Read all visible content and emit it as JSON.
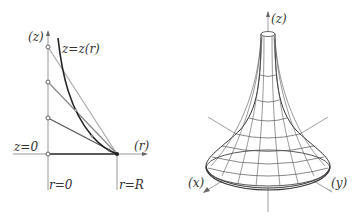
{
  "left_diagram": {
    "labels": {
      "z_axis": "(z)",
      "curve": "z=z(r)",
      "z_zero": "z=0",
      "r_axis": "(r)",
      "r_zero": "r=0",
      "r_R": "r=R"
    },
    "colors": {
      "curve": "#222222",
      "tangent_light": "#aaaaaa",
      "tangent_mid": "#888888",
      "tangent_dark": "#555555",
      "axis": "#999999"
    }
  },
  "right_diagram": {
    "labels": {
      "z_axis": "(z)",
      "x_axis": "(x)",
      "y_axis": "(y)"
    }
  }
}
